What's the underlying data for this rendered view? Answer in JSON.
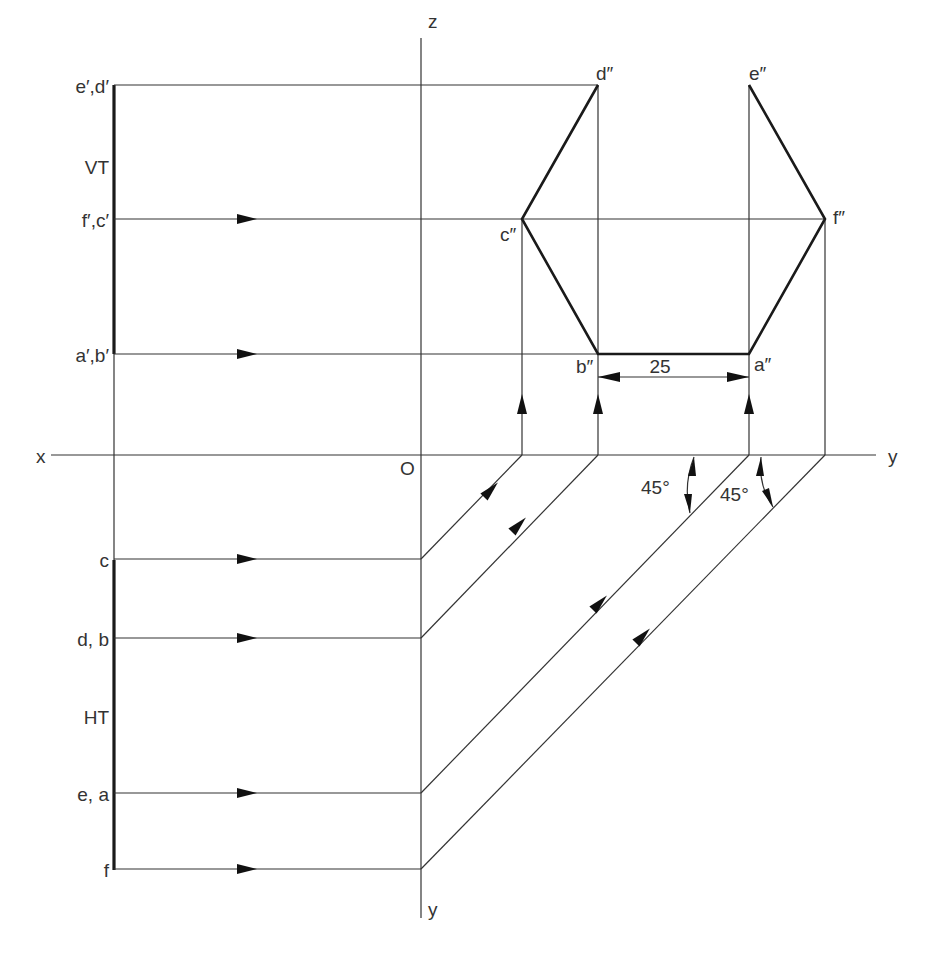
{
  "axes": {
    "x_label": "x",
    "y_label_right": "y",
    "y_label_bottom": "y",
    "z_label": "z",
    "origin_label": "O"
  },
  "traces": {
    "vt_label": "VT",
    "ht_label": "HT"
  },
  "front_view_labels": {
    "top": "e′,d′",
    "middle": "f′,c′",
    "bottom": "a′,b′"
  },
  "top_view_labels": {
    "row1": "c",
    "row2": "d, b",
    "row3": "e, a",
    "row4": "f"
  },
  "side_view_labels": {
    "d": "d″",
    "e": "e″",
    "c": "c″",
    "f": "f″",
    "b": "b″",
    "a": "a″"
  },
  "dimension": {
    "value": "25"
  },
  "angles": {
    "angle1": "45°",
    "angle2": "45°"
  }
}
